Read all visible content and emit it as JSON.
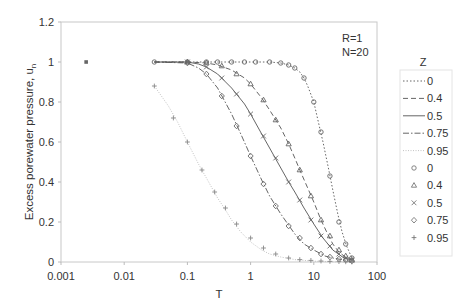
{
  "chart_data": {
    "type": "scatter",
    "title": "",
    "xlabel": "T",
    "ylabel": "Excess porewater pressure, u_n",
    "ylabel_main": "Excess porewater pressure, u",
    "ylabel_sub": "n",
    "xscale": "log",
    "xlim": [
      0.001,
      100
    ],
    "ylim": [
      0,
      1.2
    ],
    "x_ticks": [
      "0.001",
      "0.01",
      "0.1",
      "1",
      "10",
      "100"
    ],
    "y_ticks": [
      "0",
      "0.2",
      "0.4",
      "0.6",
      "0.8",
      "1",
      "1.2"
    ],
    "grid": false,
    "annotations": [
      "R=1",
      "N=20"
    ],
    "legend_title": "Z",
    "legend_position": "right",
    "legend_entries": [
      {
        "label": "0",
        "style": "dotted-line"
      },
      {
        "label": "0.4",
        "style": "dashed-line"
      },
      {
        "label": "0.5",
        "style": "solid-line"
      },
      {
        "label": "0.75",
        "style": "dash-dot-line"
      },
      {
        "label": "0.95",
        "style": "light-dotted-line"
      },
      {
        "label": "0",
        "style": "circle-marker"
      },
      {
        "label": "0.4",
        "style": "triangle-marker"
      },
      {
        "label": "0.5",
        "style": "x-marker"
      },
      {
        "label": "0.75",
        "style": "diamond-marker"
      },
      {
        "label": "0.95",
        "style": "plus-marker"
      }
    ],
    "series": [
      {
        "name": "Z=0 (analytical)",
        "kind": "line",
        "dash": "1.5,2",
        "color": "#555555",
        "x": [
          0.03,
          0.1,
          0.3,
          1,
          2,
          3,
          4,
          5,
          6,
          7,
          8,
          10,
          12,
          14,
          17,
          20,
          24,
          28,
          33,
          40
        ],
        "y": [
          1.0,
          1.0,
          1.0,
          1.0,
          1.0,
          0.995,
          0.985,
          0.97,
          0.95,
          0.92,
          0.88,
          0.8,
          0.69,
          0.6,
          0.47,
          0.36,
          0.24,
          0.15,
          0.08,
          0.02
        ]
      },
      {
        "name": "Z=0.4 (analytical)",
        "kind": "line",
        "dash": "5,3",
        "color": "#555555",
        "x": [
          0.03,
          0.1,
          0.2,
          0.3,
          0.5,
          0.8,
          1,
          1.5,
          2,
          3,
          4,
          5,
          6,
          8,
          10,
          13,
          16,
          20,
          25,
          30,
          40
        ],
        "y": [
          1.0,
          1.0,
          0.995,
          0.985,
          0.96,
          0.92,
          0.89,
          0.82,
          0.76,
          0.67,
          0.59,
          0.52,
          0.46,
          0.37,
          0.3,
          0.21,
          0.15,
          0.09,
          0.05,
          0.03,
          0.01
        ]
      },
      {
        "name": "Z=0.5 (analytical)",
        "kind": "line",
        "dash": "",
        "color": "#555555",
        "x": [
          0.03,
          0.1,
          0.15,
          0.2,
          0.3,
          0.5,
          0.8,
          1,
          1.5,
          2,
          3,
          4,
          5,
          7,
          10,
          14,
          20,
          30,
          40
        ],
        "y": [
          1.0,
          1.0,
          0.99,
          0.975,
          0.94,
          0.87,
          0.79,
          0.74,
          0.64,
          0.57,
          0.47,
          0.4,
          0.35,
          0.27,
          0.19,
          0.12,
          0.06,
          0.02,
          0.01
        ]
      },
      {
        "name": "Z=0.75 (analytical)",
        "kind": "line",
        "dash": "6,2,1.5,2",
        "color": "#555555",
        "x": [
          0.03,
          0.1,
          0.15,
          0.2,
          0.3,
          0.5,
          0.7,
          1,
          1.5,
          2,
          3,
          5,
          7,
          10,
          15,
          20,
          30,
          40
        ],
        "y": [
          1.0,
          0.995,
          0.97,
          0.94,
          0.87,
          0.74,
          0.64,
          0.53,
          0.41,
          0.33,
          0.24,
          0.14,
          0.09,
          0.06,
          0.03,
          0.02,
          0.01,
          0.0
        ]
      },
      {
        "name": "Z=0.95 (analytical)",
        "kind": "line",
        "dash": "1,1.5",
        "color": "#bbbbbb",
        "x": [
          0.03,
          0.05,
          0.07,
          0.1,
          0.15,
          0.2,
          0.3,
          0.4,
          0.5,
          0.7,
          1,
          1.5,
          2,
          3,
          5,
          10,
          20,
          40
        ],
        "y": [
          0.88,
          0.78,
          0.7,
          0.6,
          0.49,
          0.42,
          0.32,
          0.26,
          0.21,
          0.15,
          0.1,
          0.06,
          0.04,
          0.025,
          0.012,
          0.004,
          0.001,
          0.0
        ]
      },
      {
        "name": "Z=0 (data)",
        "kind": "marker",
        "marker": "circle",
        "color": "#666666",
        "x": [
          0.0025,
          0.03,
          0.1,
          0.2,
          0.3,
          0.5,
          0.8,
          1.2,
          2,
          3,
          4,
          5,
          7,
          10,
          13,
          18,
          25,
          32,
          40
        ],
        "y": [
          1.0,
          1.0,
          1.0,
          1.0,
          1.0,
          1.0,
          1.0,
          1.0,
          1.0,
          0.995,
          0.985,
          0.97,
          0.92,
          0.8,
          0.65,
          0.43,
          0.2,
          0.09,
          0.02
        ]
      },
      {
        "name": "Z=0.4 (data)",
        "kind": "marker",
        "marker": "triangle",
        "color": "#666666",
        "x": [
          0.1,
          0.2,
          0.35,
          0.6,
          1,
          1.6,
          2.5,
          4,
          6,
          9,
          13,
          18,
          25,
          32,
          40
        ],
        "y": [
          1.0,
          0.995,
          0.98,
          0.94,
          0.89,
          0.81,
          0.71,
          0.59,
          0.46,
          0.33,
          0.21,
          0.13,
          0.06,
          0.03,
          0.01
        ]
      },
      {
        "name": "Z=0.5 (data)",
        "kind": "marker",
        "marker": "x",
        "color": "#666666",
        "x": [
          0.1,
          0.2,
          0.35,
          0.6,
          1,
          1.6,
          2.5,
          4,
          6,
          9,
          13,
          18,
          25,
          32,
          40
        ],
        "y": [
          1.0,
          0.975,
          0.92,
          0.84,
          0.74,
          0.63,
          0.52,
          0.4,
          0.31,
          0.21,
          0.13,
          0.08,
          0.04,
          0.02,
          0.01
        ]
      },
      {
        "name": "Z=0.75 (data)",
        "kind": "marker",
        "marker": "diamond",
        "color": "#666666",
        "x": [
          0.1,
          0.2,
          0.35,
          0.6,
          1,
          1.6,
          2.5,
          4,
          6,
          9,
          13,
          18,
          25,
          32,
          40
        ],
        "y": [
          0.995,
          0.94,
          0.83,
          0.68,
          0.53,
          0.39,
          0.28,
          0.18,
          0.12,
          0.07,
          0.04,
          0.025,
          0.015,
          0.01,
          0.005
        ]
      },
      {
        "name": "Z=0.95 (data)",
        "kind": "marker",
        "marker": "plus",
        "color": "#888888",
        "x": [
          0.03,
          0.06,
          0.1,
          0.17,
          0.27,
          0.4,
          0.6,
          1,
          1.6,
          2.5,
          4,
          6,
          9,
          13,
          18,
          25,
          32,
          40
        ],
        "y": [
          0.88,
          0.72,
          0.6,
          0.46,
          0.35,
          0.27,
          0.19,
          0.12,
          0.07,
          0.04,
          0.02,
          0.012,
          0.008,
          0.005,
          0.003,
          0.002,
          0.001,
          0.0
        ]
      }
    ]
  }
}
